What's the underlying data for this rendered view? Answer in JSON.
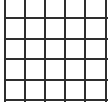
{
  "grid": {
    "rows": 5,
    "cols": 5,
    "line_color": "#2e2e2e",
    "background": "#ffffff",
    "vertical_lines_x": [
      5,
      25,
      45,
      65,
      85,
      106
    ],
    "horizontal_lines_y": [
      18,
      39,
      59,
      80,
      100
    ]
  }
}
